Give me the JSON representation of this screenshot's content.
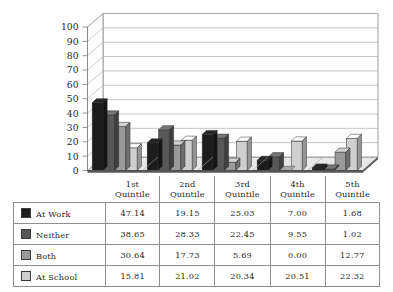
{
  "chart_data": {
    "type": "bar",
    "title": "",
    "subtitle": "",
    "xlabel": "",
    "ylabel": "",
    "ylim": [
      0,
      100
    ],
    "ytick_step": 10,
    "yticks": [
      "0",
      "10",
      "20",
      "30",
      "40",
      "50",
      "60",
      "70",
      "80",
      "90",
      "100"
    ],
    "grid": true,
    "legend_position": "table-below",
    "style": "3d-clustered-column",
    "categories": [
      "1st Quintile",
      "2nd Quintile",
      "3rd Quintile",
      "4th Quintile",
      "5th Quintile"
    ],
    "category_lines": [
      [
        "1st",
        "Quintile"
      ],
      [
        "2nd",
        "Quintile"
      ],
      [
        "3rd",
        "Quintile"
      ],
      [
        "4th",
        "Quintile"
      ],
      [
        "5th",
        "Quintile"
      ]
    ],
    "series": [
      {
        "name": "At Work",
        "color": "#1c1c1c",
        "values": [
          47.14,
          19.15,
          25.03,
          7.0,
          1.68
        ]
      },
      {
        "name": "Neither",
        "color": "#585858",
        "values": [
          38.65,
          28.33,
          22.45,
          9.55,
          1.02
        ]
      },
      {
        "name": "Both",
        "color": "#9a9a9a",
        "values": [
          30.64,
          17.73,
          5.69,
          0.0,
          12.77
        ]
      },
      {
        "name": "At School",
        "color": "#cfcfcf",
        "values": [
          15.81,
          21.02,
          20.34,
          20.51,
          22.32
        ]
      }
    ]
  },
  "table": {
    "corner_label": "",
    "column_headers": [
      "1st Quintile",
      "2nd Quintile",
      "3rd Quintile",
      "4th Quintile",
      "5th Quintile"
    ],
    "rows": [
      {
        "label": "At Work",
        "swatch_color": "#1c1c1c",
        "values": [
          "47.14",
          "19.15",
          "25.03",
          "7.00",
          "1.68"
        ]
      },
      {
        "label": "Neither",
        "swatch_color": "#585858",
        "values": [
          "38.65",
          "28.33",
          "22.45",
          "9.55",
          "1.02"
        ]
      },
      {
        "label": "Both",
        "swatch_color": "#9a9a9a",
        "values": [
          "30.64",
          "17.73",
          "5.69",
          "0.00",
          "12.77"
        ]
      },
      {
        "label": "At School",
        "swatch_color": "#cfcfcf",
        "values": [
          "15.81",
          "21.02",
          "20.34",
          "20.51",
          "22.32"
        ]
      }
    ]
  },
  "colors": {
    "background": "#ffffff",
    "axis": "#8a8a8a",
    "gridline": "#b5b5b5",
    "plot_wall": "#ffffff",
    "floor": "#e8e8e8",
    "text": "#1f1f1f",
    "table_border": "#8f8f8f"
  }
}
